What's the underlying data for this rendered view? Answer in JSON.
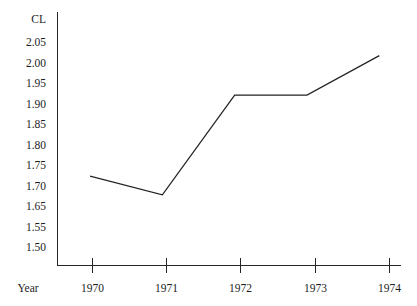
{
  "chart_data": {
    "type": "line",
    "title": "",
    "xlabel": "Year",
    "ylabel": "CL",
    "x": [
      1970,
      1971,
      1972,
      1973,
      1974
    ],
    "values": [
      1.69,
      1.645,
      1.885,
      1.885,
      1.98
    ],
    "series": [
      {
        "name": "CL",
        "values": [
          1.69,
          1.645,
          1.885,
          1.885,
          1.98
        ]
      }
    ],
    "xtick_labels": [
      "1970",
      "1971",
      "1972",
      "1973",
      "1974"
    ],
    "ytick_labels": [
      "2.05",
      "2.00",
      "1.95",
      "1.90",
      "1.85",
      "1.80",
      "1.75",
      "1.70",
      "1.65",
      "",
      "1.55",
      "1.50"
    ],
    "ytick_values": [
      2.05,
      2.0,
      1.95,
      1.9,
      1.85,
      1.8,
      1.75,
      1.7,
      1.65,
      1.6,
      1.55,
      1.5
    ],
    "ylim": [
      1.475,
      2.085
    ],
    "xlim": [
      1969.55,
      1974.3
    ],
    "grid": false,
    "legend": false,
    "markers": false,
    "line_color": "#232323"
  },
  "axes": {
    "y_axis_name": "CL",
    "x_axis_name": "Year"
  }
}
